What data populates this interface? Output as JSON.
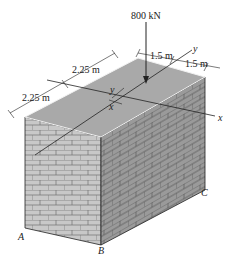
{
  "figure": {
    "load": {
      "label": "800 kN",
      "value": 800,
      "unit": "kN"
    },
    "dimensions": {
      "left_upper": "2.25 m",
      "left_lower": "2.25 m",
      "right_inner": "1.5 m",
      "right_outer": "1.5 m"
    },
    "axes": {
      "x": "x",
      "y": "y"
    },
    "offsets": {
      "x_offset": "x",
      "y_offset": "y"
    },
    "points": {
      "A": "A",
      "B": "B",
      "C": "C"
    },
    "colors": {
      "top_face": "#a9a9a9",
      "front_face": "#c8c8c8",
      "side_face": "#9a9a9a",
      "mortar": "#6e6e6e",
      "line": "#222222"
    }
  }
}
